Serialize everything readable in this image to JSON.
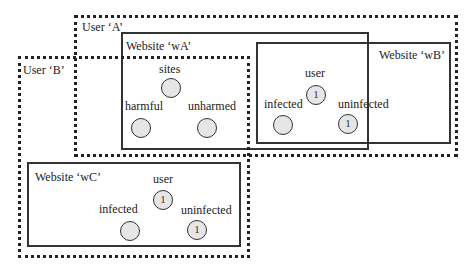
{
  "user_a": {
    "label": "User ‘A’"
  },
  "user_b": {
    "label": "User ‘B’"
  },
  "website_wa": {
    "label": "Website ‘wA’",
    "nodes": {
      "sites": "sites",
      "harmful": "harmful",
      "unharmed": "unharmed"
    },
    "values": {
      "sites": "",
      "harmful": "",
      "unharmed": ""
    }
  },
  "website_wb": {
    "label": "Website ‘wB’",
    "nodes": {
      "user": "user",
      "infected": "infected",
      "uninfected": "uninfected"
    },
    "values": {
      "user": "1",
      "infected": "",
      "uninfected": "1"
    }
  },
  "website_wc": {
    "label": "Website ‘wC’",
    "nodes": {
      "user": "user",
      "infected": "infected",
      "uninfected": "uninfected"
    },
    "values": {
      "user": "1",
      "infected": "",
      "uninfected": "1"
    }
  },
  "colors": {
    "line": "#333333",
    "node_fill": "#e6e6e6",
    "background": "#ffffff"
  }
}
